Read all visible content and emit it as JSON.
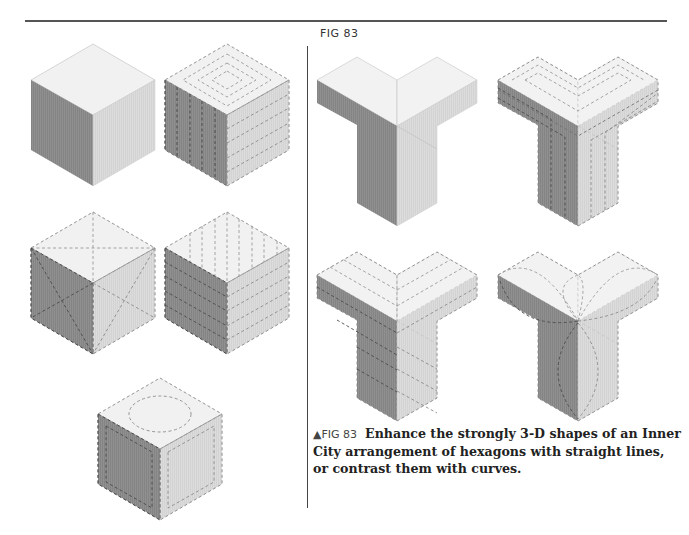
{
  "page": {
    "figure_label": "FIG 83",
    "caption": {
      "marker": "▲",
      "figure_number": "FIG 83",
      "text": "Enhance the strongly 3-D shapes of an Inner City arrangement of hexagons with straight lines, or contrast them with curves."
    }
  },
  "colors": {
    "top_face": "#f1f1f1",
    "left_face": "#8e8e8e",
    "right_face": "#dadada",
    "quilt_line": "#777777",
    "rule": "#555555"
  },
  "diagram": {
    "left_panel": {
      "cubes": [
        {
          "id": "cube-plain",
          "pattern": "none"
        },
        {
          "id": "cube-concentric-and-parallel",
          "pattern": "concentric squares on top, vertical lines on left face, horizontal lines on right face"
        },
        {
          "id": "cube-diagonal-cross",
          "pattern": "diagonal X on each face"
        },
        {
          "id": "cube-parallel-lines",
          "pattern": "parallel lines on all faces"
        },
        {
          "id": "cube-circle-and-inset",
          "pattern": "circle on top, inset borders on side faces"
        }
      ]
    },
    "right_panel": {
      "y_shapes": [
        {
          "id": "y-plain",
          "pattern": "none"
        },
        {
          "id": "y-echo-lines",
          "pattern": "echo lines following shape"
        },
        {
          "id": "y-chevron-lines",
          "pattern": "parallel straight lines"
        },
        {
          "id": "y-curves",
          "pattern": "curved arcs contrasting with the straight shapes"
        }
      ]
    }
  }
}
